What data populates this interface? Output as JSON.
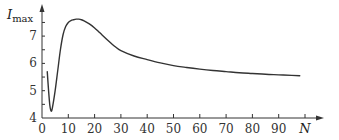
{
  "chart_data": {
    "type": "line",
    "title": "",
    "xlabel": "N",
    "ylabel": "I_max",
    "ylabel_main": "I",
    "ylabel_sub": "max",
    "xlim": [
      0,
      100
    ],
    "ylim": [
      4,
      7.8
    ],
    "x_ticks": [
      0,
      10,
      20,
      30,
      40,
      50,
      60,
      70,
      80,
      90,
      100
    ],
    "x_tick_labels": [
      "0",
      "10",
      "20",
      "30",
      "40",
      "50",
      "60",
      "70",
      "80",
      "90",
      "N"
    ],
    "y_ticks": [
      4,
      4.5,
      5,
      5.5,
      6,
      6.5,
      7,
      7.5
    ],
    "y_tick_labels": [
      "4",
      "",
      "5",
      "",
      "6",
      "",
      "7",
      ""
    ],
    "grid": false,
    "legend": null,
    "series": [
      {
        "name": "I_max(N)",
        "color": "#333333",
        "x": [
          2,
          2.5,
          3,
          3.5,
          4,
          5,
          6,
          7,
          8,
          9,
          10,
          11,
          12,
          13,
          14,
          15,
          16,
          18,
          20,
          22,
          25,
          28,
          30,
          35,
          40,
          45,
          50,
          55,
          60,
          65,
          70,
          75,
          80,
          85,
          90,
          95,
          98
        ],
        "y": [
          5.7,
          5.0,
          4.45,
          4.25,
          4.4,
          5.0,
          5.75,
          6.5,
          7.05,
          7.35,
          7.5,
          7.57,
          7.6,
          7.62,
          7.62,
          7.6,
          7.56,
          7.45,
          7.3,
          7.12,
          6.85,
          6.6,
          6.47,
          6.27,
          6.14,
          6.02,
          5.92,
          5.85,
          5.79,
          5.74,
          5.7,
          5.66,
          5.63,
          5.6,
          5.58,
          5.56,
          5.55
        ]
      }
    ]
  },
  "axes": {
    "x_title": "N",
    "y_title_main": "I",
    "y_title_sub": "max"
  }
}
